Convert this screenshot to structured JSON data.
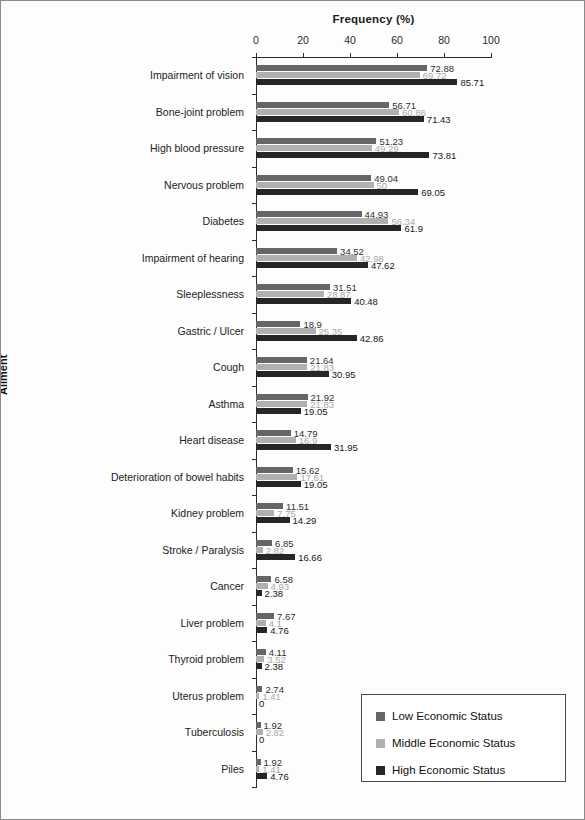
{
  "chart_data": {
    "type": "bar",
    "orientation": "horizontal",
    "title": "",
    "xlabel": "Frequency (%)",
    "ylabel": "Ailment",
    "xlim": [
      0,
      100
    ],
    "xticks": [
      0,
      20,
      40,
      60,
      80,
      100
    ],
    "grid": false,
    "legend_position": "bottom-right",
    "categories": [
      "Impairment  of vision",
      "Bone-joint  problem",
      "High blood pressure",
      "Nervous problem",
      "Diabetes",
      "Impairment  of hearing",
      "Sleeplessness",
      "Gastric / Ulcer",
      "Cough",
      "Asthma",
      "Heart disease",
      "Deterioration of bowel habits",
      "Kidney problem",
      "Stroke / Paralysis",
      "Cancer",
      "Liver problem",
      "Thyroid problem",
      "Uterus problem",
      "Tuberculosis",
      "Piles"
    ],
    "series": [
      {
        "name": "Low Economic Status",
        "color": "#666666",
        "values": [
          72.88,
          56.71,
          51.23,
          49.04,
          44.93,
          34.52,
          31.51,
          18.9,
          21.64,
          21.92,
          14.79,
          15.62,
          11.51,
          6.85,
          6.58,
          7.67,
          4.11,
          2.74,
          1.92,
          1.92
        ]
      },
      {
        "name": "Middle Economic Status",
        "color": "#b0b0b0",
        "values": [
          69.72,
          60.86,
          49.29,
          50,
          56.34,
          42.98,
          28.87,
          25.35,
          21.83,
          21.83,
          16.9,
          17.61,
          7.75,
          2.82,
          4.93,
          4.1,
          3.52,
          1.41,
          2.82,
          1.41
        ]
      },
      {
        "name": "High Economic Status",
        "color": "#262626",
        "values": [
          85.71,
          71.43,
          73.81,
          69.05,
          61.9,
          47.62,
          40.48,
          42.86,
          30.95,
          19.05,
          31.95,
          19.05,
          14.29,
          16.66,
          2.38,
          4.76,
          2.38,
          0,
          0,
          4.76
        ]
      }
    ],
    "value_labels": {
      "low": [
        "72.88",
        "56.71",
        "51.23",
        "49.04",
        "44.93",
        "34.52",
        "31.51",
        "18.9",
        "21.64",
        "21.92",
        "14.79",
        "15.62",
        "11.51",
        "6.85",
        "6.58",
        "7.67",
        "4.11",
        "2.74",
        "1.92",
        "1.92"
      ],
      "middle": [
        "69.72",
        "60.86",
        "49.29",
        "50",
        "56.34",
        "42.98",
        "28.87",
        "25.35",
        "21.83",
        "21.83",
        "16.9",
        "17.61",
        "7.75",
        "2.82",
        "4.93",
        "4.1",
        "3.52",
        "1.41",
        "2.82",
        "1.41"
      ],
      "high": [
        "85.71",
        "71.43",
        "73.81",
        "69.05",
        "61.9",
        "47.62",
        "40.48",
        "42.86",
        "30.95",
        "19.05",
        "31.95",
        "19.05",
        "14.29",
        "16.66",
        "2.38",
        "4.76",
        "2.38",
        "0",
        "0",
        "4.76"
      ]
    }
  },
  "legend": {
    "items": [
      {
        "label": "Low Economic Status"
      },
      {
        "label": "Middle Economic Status"
      },
      {
        "label": "High Economic Status"
      }
    ]
  }
}
